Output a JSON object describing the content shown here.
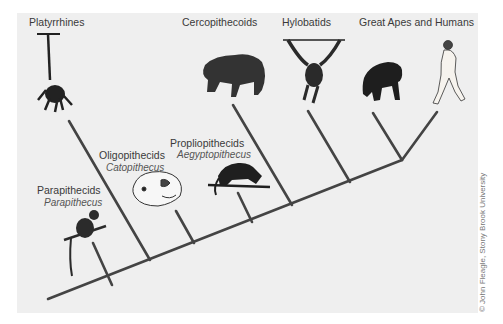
{
  "diagram": {
    "type": "phylogenetic-tree",
    "taxa": [
      {
        "id": "platyrrhines",
        "label": "Platyrrhines",
        "genus": null
      },
      {
        "id": "parapithecids",
        "label": "Parapithecids",
        "genus": "Parapithecus"
      },
      {
        "id": "oligopithecids",
        "label": "Oligopithecids",
        "genus": "Catopithecus"
      },
      {
        "id": "propliopithecids",
        "label": "Propliopithecids",
        "genus": "Aegyptopithecus"
      },
      {
        "id": "cercopithecoids",
        "label": "Cercopithecoids",
        "genus": null
      },
      {
        "id": "hylobatids",
        "label": "Hylobatids",
        "genus": null
      },
      {
        "id": "great-apes-humans",
        "label": "Great Apes and Humans",
        "genus": null
      }
    ],
    "illustrations": [
      "spider-monkey-hanging",
      "parapithecus-on-branch",
      "catopithecus-skull",
      "aegyptopithecus-walking",
      "baboon-walking",
      "gibbon-hanging",
      "chimpanzee-knuckle-walking",
      "human-walking"
    ],
    "credit": "© John Fleagle, Stony Brook University",
    "colors": {
      "background": "#efefef",
      "line": "#444444",
      "text": "#3a3a3a"
    }
  }
}
